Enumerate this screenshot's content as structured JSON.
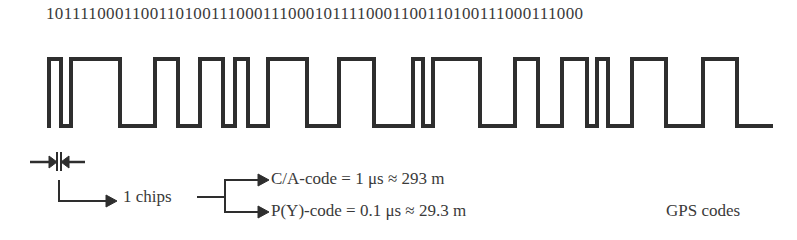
{
  "diagram": {
    "bit_sequence": "10111100011001101001110001110001011110001100110100111000111000",
    "waveform": {
      "high_y": 59,
      "low_y": 126,
      "start_x": 49,
      "end_x": 773,
      "transitions_x": [
        49,
        61,
        71,
        120,
        155,
        178,
        200,
        223,
        235,
        248,
        268,
        307,
        339,
        374,
        413,
        423,
        433,
        480,
        515,
        538,
        562,
        587,
        597,
        608,
        632,
        666,
        703,
        737
      ]
    },
    "chip_label": "1 chips",
    "branches": [
      {
        "label": "C/A-code = 1 μs ≈ 293 m"
      },
      {
        "label": "P(Y)-code = 0.1 μs ≈ 29.3 m"
      }
    ],
    "caption": "GPS codes",
    "colors": {
      "line": "#2e2e2e",
      "text": "#3a3a3a"
    }
  }
}
